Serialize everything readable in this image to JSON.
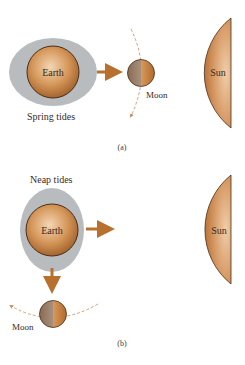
{
  "figure": {
    "panel_a": {
      "title": "Spring tides",
      "caption": "(a)",
      "earth_label": "Earth",
      "moon_label": "Moon",
      "sun_label": "Sun"
    },
    "panel_b": {
      "title": "Neap tides",
      "caption": "(b)",
      "earth_label": "Earth",
      "moon_label": "Moon",
      "sun_label": "Sun"
    },
    "colors": {
      "body_fill": "#c8874a",
      "body_dark": "#9a5a26",
      "body_light": "#f3d6b4",
      "outline": "#4a2e18",
      "tide_bulge": "#b9bcbf",
      "arrow": "#b8702f",
      "orbit": "#c48a5a"
    }
  }
}
